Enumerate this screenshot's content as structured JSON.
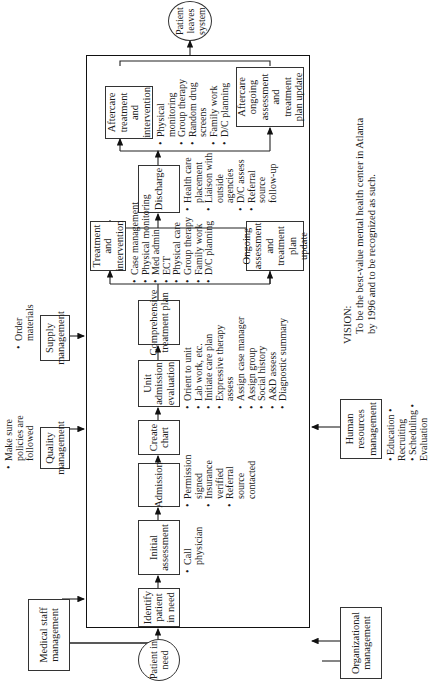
{
  "terminals": {
    "start": "Patient in need",
    "end": "Patient leaves system"
  },
  "process_steps": [
    {
      "label": "Identify patient in need",
      "bullets": []
    },
    {
      "label": "Initial assessment",
      "bullets": [
        "Call physician"
      ]
    },
    {
      "label": "Admission",
      "bullets": [
        "Permission signed",
        "Insurance verified",
        "Referral source contacted"
      ]
    },
    {
      "label": "Create chart",
      "bullets": []
    },
    {
      "label": "Unit admission evaluation",
      "bullets": [
        "Orient to unit",
        "Lab work, etc.",
        "Initiate care plan",
        "Expressive therapy assess",
        "Assign case manager",
        "Assign group",
        "Social history",
        "A&D assess",
        "Diagnostic summary"
      ]
    },
    {
      "label": "Comprehensive treatment plan",
      "bullets": []
    },
    {
      "label": "Treatment and intervention",
      "bullets": [
        "Case management",
        "Physical monitoring",
        "Med admin",
        "ECT",
        "Physical care",
        "Group therapy",
        "Family work",
        "D/C planning"
      ]
    },
    {
      "label": "Discharge",
      "bullets": [
        "Health care placement",
        "Liaison with outside agencies",
        "D/C assess",
        "Referral source follow-up"
      ]
    },
    {
      "label": "Aftercare treatment and intervention",
      "bullets": [
        "Physical monitoring",
        "Group therapy",
        "Random drug screens",
        "Family work",
        "D/C planning"
      ]
    }
  ],
  "loop_boxes": {
    "ongoing": "Ongoing assessment and treatment plan update",
    "aftercare_ongoing": "Aftercare ongoing assessment and treatment plan update"
  },
  "support_functions": {
    "top": [
      {
        "label": "Medical staff management",
        "notes": []
      },
      {
        "label": "Quality management",
        "notes": [
          "Make sure policies are followed"
        ]
      },
      {
        "label": "Supply management",
        "notes": [
          "Order materials"
        ]
      }
    ],
    "bottom": [
      {
        "label": "Organizational management",
        "notes": []
      },
      {
        "label": "Human resources management",
        "notes": [
          "Education",
          "Recruiting",
          "Scheduling",
          "Evaluation"
        ]
      }
    ]
  },
  "vision": {
    "heading": "VISION:",
    "line1": "To be the best-value mental health center in Atlanta",
    "line2": "by 1996 and to be recognized as such."
  }
}
